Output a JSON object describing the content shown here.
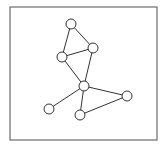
{
  "diagram": {
    "type": "undirected-graph",
    "frame": {
      "x": 10,
      "y": 7,
      "width": 147,
      "height": 133,
      "stroke": "#6b6b6b"
    },
    "node_style": {
      "radius": 5,
      "fill": "#ffffff",
      "stroke": "#333333"
    },
    "edge_style": {
      "stroke": "#333333"
    },
    "nodes": [
      {
        "id": "n1",
        "x": 71,
        "y": 24
      },
      {
        "id": "n2",
        "x": 93,
        "y": 48
      },
      {
        "id": "n3",
        "x": 62,
        "y": 57
      },
      {
        "id": "n4",
        "x": 84,
        "y": 86
      },
      {
        "id": "n5",
        "x": 127,
        "y": 96
      },
      {
        "id": "n6",
        "x": 49,
        "y": 109
      },
      {
        "id": "n7",
        "x": 80,
        "y": 115
      }
    ],
    "edges": [
      [
        "n1",
        "n2"
      ],
      [
        "n1",
        "n3"
      ],
      [
        "n3",
        "n2"
      ],
      [
        "n3",
        "n4"
      ],
      [
        "n2",
        "n4"
      ],
      [
        "n4",
        "n5"
      ],
      [
        "n4",
        "n6"
      ],
      [
        "n4",
        "n7"
      ],
      [
        "n7",
        "n5"
      ]
    ]
  }
}
